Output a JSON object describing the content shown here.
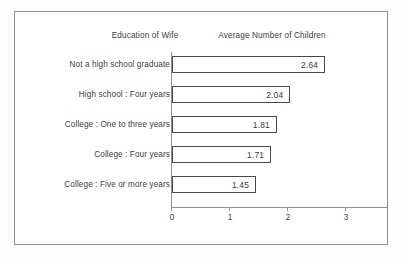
{
  "headers": {
    "left": "Education of Wife",
    "right": "Average Number of Children"
  },
  "axis": {
    "ticks": [
      "0",
      "1",
      "2",
      "3"
    ]
  },
  "chart_data": {
    "type": "bar",
    "orientation": "horizontal",
    "title": "",
    "xlabel": "Average Number of Children",
    "ylabel": "Education of Wife",
    "xlim": [
      0,
      3.7
    ],
    "xticks": [
      0,
      1,
      2,
      3
    ],
    "grid": false,
    "legend": null,
    "categories": [
      "Not a high school graduate",
      "High school : Four years",
      "College : One to three years",
      "College : Four years",
      "College : Five or more years"
    ],
    "values": [
      2.64,
      2.04,
      1.81,
      1.71,
      1.45
    ],
    "value_labels": [
      "2.64",
      "2.04",
      "1.81",
      "1.71",
      "1.45"
    ],
    "bar_face_color": "#ffffff",
    "bar_edge_color": "#4a4a4a"
  }
}
